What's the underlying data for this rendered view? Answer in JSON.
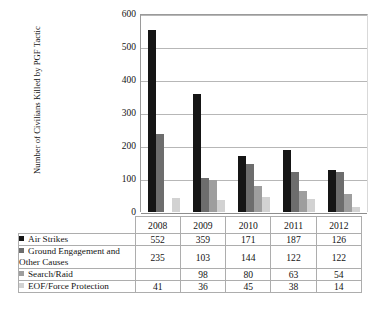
{
  "chart_data": {
    "type": "bar",
    "title": "",
    "xlabel": "",
    "ylabel": "Number of Civilians Killed by PGF Tactic",
    "ylim": [
      0,
      600
    ],
    "yticks": [
      600,
      500,
      400,
      300,
      200,
      100,
      0
    ],
    "grid": "horizontal",
    "legend_position": "table-below",
    "categories": [
      "2008",
      "2009",
      "2010",
      "2011",
      "2012"
    ],
    "series": [
      {
        "name": "Air Strikes",
        "color": "#151515",
        "values": [
          552,
          359,
          171,
          187,
          126
        ],
        "display": [
          "552",
          "359",
          "171",
          "187",
          "126"
        ]
      },
      {
        "name": "Ground Engagement and Other Causes",
        "color": "#6d6d6d",
        "values": [
          235,
          103,
          144,
          122,
          122
        ],
        "display": [
          "235",
          "103",
          "144",
          "122",
          "122"
        ]
      },
      {
        "name": "Search/Raid",
        "color": "#9e9e9e",
        "values": [
          null,
          98,
          80,
          63,
          54
        ],
        "display": [
          "",
          "98",
          "80",
          "63",
          "54"
        ]
      },
      {
        "name": "EOF/Force Protection",
        "color": "#d2d2d2",
        "values": [
          41,
          36,
          45,
          38,
          14
        ],
        "display": [
          "41",
          "36",
          "45",
          "38",
          "14"
        ]
      }
    ]
  },
  "table": {
    "corner_label": "",
    "column_headers": [
      "2008",
      "2009",
      "2010",
      "2011",
      "2012"
    ],
    "rows": [
      {
        "label": "Air Strikes",
        "swatch_color": "#151515",
        "swatch_icon": "legend-swatch-icon",
        "values": [
          "552",
          "359",
          "171",
          "187",
          "126"
        ]
      },
      {
        "label": "Ground Engagement and Other Causes",
        "swatch_color": "#6d6d6d",
        "swatch_icon": "legend-swatch-icon",
        "values": [
          "235",
          "103",
          "144",
          "122",
          "122"
        ]
      },
      {
        "label": "Search/Raid",
        "swatch_color": "#9e9e9e",
        "swatch_icon": "legend-swatch-icon",
        "values": [
          "",
          "98",
          "80",
          "63",
          "54"
        ]
      },
      {
        "label": "EOF/Force Protection",
        "swatch_color": "#d2d2d2",
        "swatch_icon": "legend-swatch-icon",
        "values": [
          "41",
          "36",
          "45",
          "38",
          "14"
        ]
      }
    ]
  }
}
